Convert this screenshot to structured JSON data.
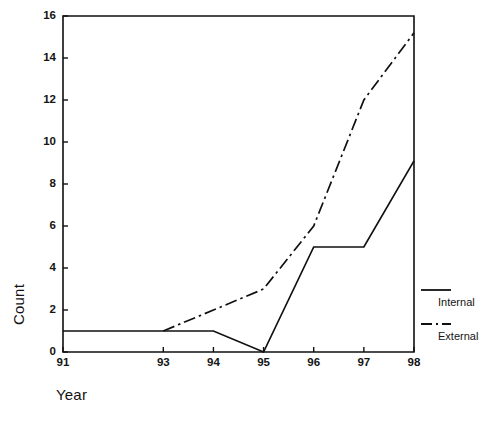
{
  "chart_data": {
    "type": "line",
    "title": "",
    "xlabel": "Year",
    "ylabel": "Count",
    "xlim": [
      91,
      98
    ],
    "ylim": [
      0,
      16
    ],
    "xticks": [
      "91",
      "93",
      "94",
      "95",
      "96",
      "97",
      "98"
    ],
    "xtick_values": [
      91,
      93,
      94,
      95,
      96,
      97,
      98
    ],
    "yticks": [
      "0",
      "2",
      "4",
      "6",
      "8",
      "10",
      "12",
      "14",
      "16"
    ],
    "ytick_values": [
      0,
      2,
      4,
      6,
      8,
      10,
      12,
      14,
      16
    ],
    "grid": false,
    "legend_position": "right",
    "series": [
      {
        "name": "Internal",
        "style": "solid",
        "color": "#101010",
        "x": [
          91,
          93,
          94,
          95,
          96,
          97,
          98
        ],
        "values": [
          1,
          1,
          1,
          0,
          5,
          5,
          9.1
        ]
      },
      {
        "name": "External",
        "style": "dash-dot",
        "color": "#101010",
        "x": [
          93,
          94,
          95,
          96,
          97,
          98
        ],
        "values": [
          1,
          2,
          3,
          6,
          12,
          15.2
        ]
      }
    ]
  },
  "legend": {
    "entries": [
      {
        "label": "Internal",
        "style": "solid"
      },
      {
        "label": "External",
        "style": "dash-dot"
      }
    ]
  },
  "axes": {
    "x_title": "Year",
    "y_title": "Count"
  }
}
